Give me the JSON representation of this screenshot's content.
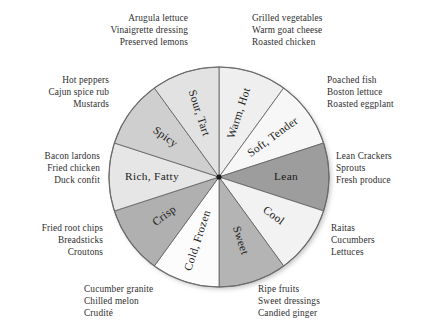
{
  "chart_data": {
    "type": "pie",
    "title": "",
    "subtitle": "",
    "xlabel": "",
    "ylabel": "",
    "legend_position": "none",
    "grid": false,
    "segment_count": 10,
    "segment_degrees": 36,
    "categories": [
      "Warm, Hot",
      "Soft, Tender",
      "Lean",
      "Cool",
      "Sweet",
      "Cold, Frozen",
      "Crisp",
      "Rich, Fatty",
      "Spicy",
      "Sour, Tart"
    ],
    "values": [
      10,
      10,
      10,
      10,
      10,
      10,
      10,
      10,
      10,
      10
    ],
    "colors": [
      "#efefef",
      "#f7f7f7",
      "#9d9d9d",
      "#f2f2f2",
      "#b4b4b4",
      "#fcfcfc",
      "#b0b0b0",
      "#e6e6e6",
      "#cfcfcf",
      "#e2e2e2"
    ],
    "annotations": [
      {
        "for": "Sour, Tart",
        "lines": [
          "Arugula lettuce",
          "Vinaigrette dressing",
          "Preserved lemons"
        ]
      },
      {
        "for": "Warm, Hot",
        "lines": [
          "Grilled vegetables",
          "Warm goat cheese",
          "Roasted chicken"
        ]
      },
      {
        "for": "Spicy",
        "lines": [
          "Hot peppers",
          "Cajun spice rub",
          "Mustards"
        ]
      },
      {
        "for": "Soft, Tender",
        "lines": [
          "Poached fish",
          "Boston lettuce",
          "Roasted eggplant"
        ]
      },
      {
        "for": "Rich, Fatty",
        "lines": [
          "Bacon lardons",
          "Fried chicken",
          "Duck confit"
        ]
      },
      {
        "for": "Lean",
        "lines": [
          "Lean Crackers",
          "Sprouts",
          "Fresh produce"
        ]
      },
      {
        "for": "Crisp",
        "lines": [
          "Fried root chips",
          "Breadsticks",
          "Croutons"
        ]
      },
      {
        "for": "Cool",
        "lines": [
          "Raitas",
          "Cucumbers",
          "Lettuces"
        ]
      },
      {
        "for": "Cold, Frozen",
        "lines": [
          "Cucumber granite",
          "Chilled melon",
          "Crudité"
        ]
      },
      {
        "for": "Sweet",
        "lines": [
          "Ripe fruits",
          "Sweet dressings",
          "Candied ginger"
        ]
      }
    ]
  },
  "wheel": {
    "segments": [
      {
        "label": "Warm, Hot",
        "color": "#efefef"
      },
      {
        "label": "Soft, Tender",
        "color": "#f7f7f7"
      },
      {
        "label": "Lean",
        "color": "#9d9d9d"
      },
      {
        "label": "Cool",
        "color": "#f2f2f2"
      },
      {
        "label": "Sweet",
        "color": "#b4b4b4"
      },
      {
        "label": "Cold, Frozen",
        "color": "#fcfcfc"
      },
      {
        "label": "Crisp",
        "color": "#b0b0b0"
      },
      {
        "label": "Rich, Fatty",
        "color": "#e6e6e6"
      },
      {
        "label": "Spicy",
        "color": "#cfcfcf"
      },
      {
        "label": "Sour, Tart",
        "color": "#e2e2e2"
      }
    ]
  },
  "notes": {
    "top_left": "Arugula lettuce\nVinaigrette dressing\nPreserved lemons",
    "top_right": "Grilled vegetables\nWarm goat cheese\nRoasted chicken",
    "upper_left": "Hot peppers\nCajun spice rub\nMustards",
    "upper_right": "Poached fish\nBoston lettuce\nRoasted eggplant",
    "mid_left": "Bacon lardons\nFried chicken\nDuck confit",
    "mid_right": "Lean Crackers\nSprouts\nFresh produce",
    "lower_left": "Fried root chips\nBreadsticks\nCroutons",
    "lower_right": "Raitas\nCucumbers\nLettuces",
    "bottom_left": "Cucumber granite\nChilled melon\nCrudité",
    "bottom_right": "Ripe fruits\nSweet dressings\nCandied ginger"
  }
}
